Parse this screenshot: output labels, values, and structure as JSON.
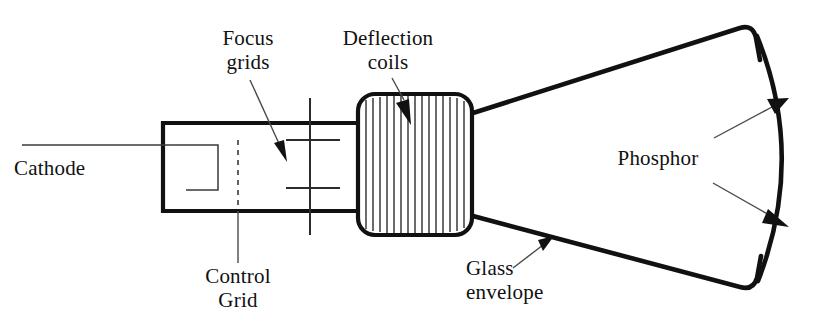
{
  "diagram": {
    "background_color": "#ffffff",
    "line_color": "#111111",
    "width": 828,
    "height": 315
  },
  "labels": {
    "cathode": "Cathode",
    "focus_grids_line1": "Focus",
    "focus_grids_line2": "grids",
    "deflection_coils_line1": "Deflection",
    "deflection_coils_line2": "coils",
    "control_grid_line1": "Control",
    "control_grid_line2": "Grid",
    "glass_envelope_line1": "Glass",
    "glass_envelope_line2": "envelope",
    "phosphor": "Phosphor"
  },
  "parts": [
    {
      "name": "cathode",
      "label": "Cathode"
    },
    {
      "name": "control-grid",
      "label": "Control Grid"
    },
    {
      "name": "focus-grids",
      "label": "Focus grids"
    },
    {
      "name": "deflection-coils",
      "label": "Deflection coils"
    },
    {
      "name": "glass-envelope",
      "label": "Glass envelope"
    },
    {
      "name": "phosphor",
      "label": "Phosphor"
    }
  ]
}
